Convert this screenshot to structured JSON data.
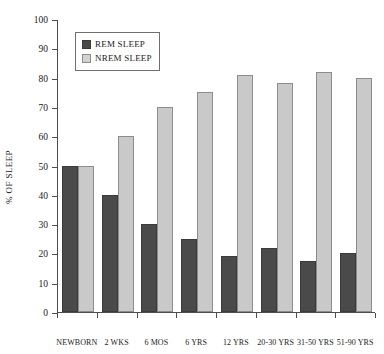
{
  "chart_data": {
    "type": "bar",
    "title": "",
    "xlabel": "",
    "ylabel": "% OF SLEEP",
    "ylim": [
      0,
      100
    ],
    "yticks": [
      0,
      10,
      20,
      30,
      40,
      50,
      60,
      70,
      80,
      90,
      100
    ],
    "ytick_labels": [
      "0",
      "10",
      "20",
      "30",
      "40",
      "50",
      "60",
      "70",
      "80",
      "90",
      "100"
    ],
    "grid": false,
    "legend_position": "upper left",
    "categories": [
      "NEWBORN",
      "2 WKS",
      "6 MOS",
      "6 YRS",
      "12 YRS",
      "20-30 YRS",
      "31-50 YRS",
      "51-90 YRS"
    ],
    "series": [
      {
        "name": "REM SLEEP",
        "color": "#4a4a4a",
        "values": [
          50,
          40,
          30,
          25,
          19,
          22,
          17.5,
          20
        ]
      },
      {
        "name": "NREM SLEEP",
        "color": "#c9c9c9",
        "values": [
          50,
          60,
          70,
          75,
          81,
          78,
          82,
          80
        ]
      }
    ]
  },
  "legend": {
    "entries": [
      {
        "label": "REM SLEEP",
        "swatch": "rem"
      },
      {
        "label": "NREM SLEEP",
        "swatch": "nrem"
      }
    ]
  }
}
